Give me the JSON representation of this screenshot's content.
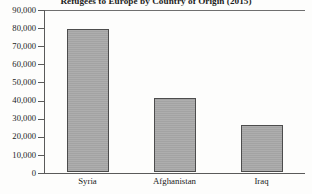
{
  "chart_data": {
    "type": "bar",
    "title": "Refugees to Europe by Country of Origin (2015)",
    "categories": [
      "Syria",
      "Afghanistan",
      "Iraq"
    ],
    "values": [
      79000,
      41000,
      26000
    ],
    "xlabel": "",
    "ylabel": "",
    "ylim": [
      0,
      90000
    ],
    "ytick_values": [
      0,
      10000,
      20000,
      30000,
      40000,
      50000,
      60000,
      70000,
      80000,
      90000
    ],
    "ytick_labels": [
      "0",
      "10,000",
      "20,000",
      "30,000",
      "40,000",
      "50,000",
      "60,000",
      "70,000",
      "80,000",
      "90,000"
    ],
    "grid": false,
    "legend": null,
    "bar_color": "#a9a9a9",
    "bar_edge_color": "#4d4d4d",
    "axis_color": "#5a5a5a"
  }
}
